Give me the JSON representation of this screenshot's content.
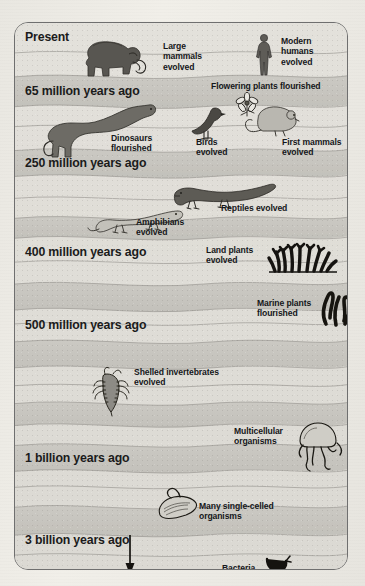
{
  "diagram": {
    "frame_border_color": "#6f6f6f",
    "background_color": "#d7d5cf",
    "band_light_color": "#dedcd6",
    "band_dark_color": "#c9c7c1",
    "text_color": "#1b1b1b"
  },
  "eras": [
    {
      "id": "present",
      "label": "Present"
    },
    {
      "id": "65-million",
      "label": "65 million years ago"
    },
    {
      "id": "250-million",
      "label": "250 million years ago"
    },
    {
      "id": "400-million",
      "label": "400 million years ago"
    },
    {
      "id": "500-million",
      "label": "500 million years ago"
    },
    {
      "id": "1-billion",
      "label": "1 billion years ago"
    },
    {
      "id": "3-billion",
      "label": "3 billion years ago"
    }
  ],
  "events": [
    {
      "id": "large-mammals",
      "label": "Large\nmammals\nevolved",
      "icon": "mammoth-icon"
    },
    {
      "id": "modern-humans",
      "label": "Modern\nhumans\nevolved",
      "icon": "human-icon"
    },
    {
      "id": "flowering-plants",
      "label": "Flowering plants flourished",
      "icon": "flower-icon"
    },
    {
      "id": "dinosaurs",
      "label": "Dinosaurs\nflourished",
      "icon": "sauropod-icon"
    },
    {
      "id": "birds",
      "label": "Birds\nevolved",
      "icon": "bird-icon"
    },
    {
      "id": "first-mammals",
      "label": "First mammals\nevolved",
      "icon": "small-mammal-icon"
    },
    {
      "id": "reptiles",
      "label": "Reptiles evolved",
      "icon": "reptile-icon"
    },
    {
      "id": "amphibians",
      "label": "Amphibians\nevolved",
      "icon": "amphibian-icon"
    },
    {
      "id": "land-plants",
      "label": "Land plants\nevolved",
      "icon": "land-plant-icon"
    },
    {
      "id": "marine-plants",
      "label": "Marine plants\nflourished",
      "icon": "seaweed-icon"
    },
    {
      "id": "shelled-invertebrates",
      "label": "Shelled invertebrates\nevolved",
      "icon": "trilobite-icon"
    },
    {
      "id": "multicellular",
      "label": "Multicellular\norganisms",
      "icon": "jellyfish-icon"
    },
    {
      "id": "single-celled",
      "label": "Many single-celled\norganisms",
      "icon": "amoeba-icon"
    },
    {
      "id": "bacteria",
      "label": "Bacteria",
      "icon": "bacteria-icon"
    }
  ],
  "arrow": {
    "id": "time-direction-arrow",
    "name": "downward time arrow",
    "direction": "down"
  }
}
